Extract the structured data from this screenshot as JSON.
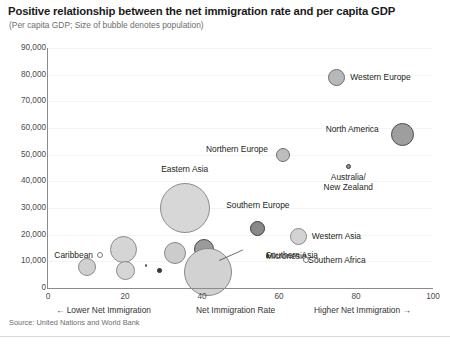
{
  "title": "Positive relationship between the net immigration rate and per capita GDP",
  "subtitle": "(Per capita GDP; Size of bubble denotes population)",
  "source": "Source: United Nations and World Bank",
  "axis": {
    "x_caption_left": "← Lower Net Immigration",
    "x_caption_center": "Net Immigration Rate",
    "x_caption_right": "Higher Net Immigration →",
    "y_ticks": [
      "0",
      "10,000",
      "20,000",
      "30,000",
      "40,000",
      "50,000",
      "60,000",
      "70,000",
      "80,000",
      "90,000"
    ],
    "x_ticks": [
      "0",
      "20",
      "40",
      "60",
      "80",
      "100"
    ]
  },
  "chart_data": {
    "type": "scatter",
    "title": "Positive relationship between the net immigration rate and per capita GDP",
    "subtitle": "(Per capita GDP; Size of bubble denotes population)",
    "xlabel": "Net Immigration Rate",
    "ylabel": "Per capita GDP",
    "xlim": [
      0,
      100
    ],
    "ylim": [
      0,
      90000
    ],
    "grid": true,
    "legend": "none",
    "size_encodes": "population",
    "points": [
      {
        "name": "Western Europe",
        "x": 75,
        "y": 79000,
        "r": 8.5,
        "fill": "#b8b8b8",
        "stroke": "#6e6e6e",
        "label_pos": "right"
      },
      {
        "name": "North America",
        "x": 92,
        "y": 57500,
        "r": 11.5,
        "fill": "#9e9e9e",
        "stroke": "#4f4f4f",
        "label_pos": "left"
      },
      {
        "name": "Northern Europe",
        "x": 61,
        "y": 50000,
        "r": 7.0,
        "fill": "#bdbdbd",
        "stroke": "#6e6e6e",
        "label_pos": "left"
      },
      {
        "name": "Australia/ New Zealand",
        "x": 78,
        "y": 45500,
        "r": 2.8,
        "fill": "#8f8f8f",
        "stroke": "#3f3f3f",
        "label_pos": "below"
      },
      {
        "name": "Eastern Asia",
        "x": 35.5,
        "y": 30000,
        "r": 25.0,
        "fill": "#d7d7d7",
        "stroke": "#8c8c8c",
        "label_pos": "above"
      },
      {
        "name": "Southern Europe",
        "x": 54.5,
        "y": 22500,
        "r": 7.5,
        "fill": "#898989",
        "stroke": "#3d3d3d",
        "label_pos": "above"
      },
      {
        "name": "Western Asia",
        "x": 65,
        "y": 19500,
        "r": 8.5,
        "fill": "#d3d3d3",
        "stroke": "#8a8a8a",
        "label_pos": "right"
      },
      {
        "name": "Southern Asia",
        "x": 41.5,
        "y": 6000,
        "r": 24.0,
        "fill": "#d2d2d2",
        "stroke": "#8a8a8a",
        "label_pos": "callout"
      },
      {
        "name": "Caribbean",
        "x": 13.5,
        "y": 12500,
        "r": 3.0,
        "fill": "#ffffff",
        "stroke": "#7a7a7a",
        "label_pos": "left"
      },
      {
        "name": "Micronesia",
        "x": 57,
        "y": 12000,
        "r": 1.6,
        "fill": "#4a4a4a",
        "stroke": "#4a4a4a",
        "label_pos": "right"
      },
      {
        "name": "Southern Africa",
        "x": 67,
        "y": 10500,
        "r": 3.4,
        "fill": "#ffffff",
        "stroke": "#7a7a7a",
        "label_pos": "right"
      }
    ],
    "unlabeled_points": [
      {
        "x": 10.0,
        "y": 8000,
        "r": 9.0,
        "fill": "#d0d0d0",
        "stroke": "#8a8a8a"
      },
      {
        "x": 19.5,
        "y": 14500,
        "r": 13.5,
        "fill": "#d5d5d5",
        "stroke": "#8a8a8a"
      },
      {
        "x": 20.0,
        "y": 6500,
        "r": 9.5,
        "fill": "#d6d6d6",
        "stroke": "#8a8a8a"
      },
      {
        "x": 25.5,
        "y": 8500,
        "r": 1.3,
        "fill": "#555555",
        "stroke": "#555555"
      },
      {
        "x": 33.0,
        "y": 13000,
        "r": 11.0,
        "fill": "#cccccc",
        "stroke": "#8a8a8a"
      },
      {
        "x": 40.5,
        "y": 14500,
        "r": 10.0,
        "fill": "#9a9a9a",
        "stroke": "#4a4a4a"
      },
      {
        "x": 29.0,
        "y": 6500,
        "r": 2.2,
        "fill": "#3a3a3a",
        "stroke": "#3a3a3a"
      },
      {
        "x": 44.0,
        "y": 8000,
        "r": 11.0,
        "fill": "#d8d8d8",
        "stroke": "#7d7d7d"
      },
      {
        "x": 45.5,
        "y": 10200,
        "r": 4.5,
        "fill": "#d8d8d8",
        "stroke": "#8a8a8a"
      }
    ]
  }
}
